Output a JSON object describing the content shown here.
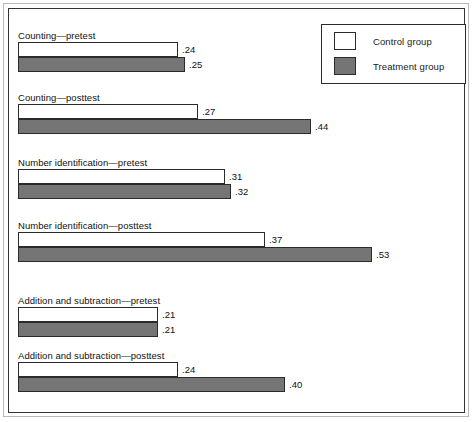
{
  "chart_data": {
    "type": "bar",
    "orientation": "horizontal",
    "title": "",
    "xlabel": "",
    "ylabel": "",
    "xlim": [
      0,
      0.62
    ],
    "grid": false,
    "legend_position": "top-right",
    "categories": [
      "Counting—pretest",
      "Counting—posttest",
      "Number identification—pretest",
      "Number identification—posttest",
      "Addition and subtraction—pretest",
      "Addition and subtraction—posttest"
    ],
    "series": [
      {
        "name": "Control group",
        "color": "#ffffff",
        "values": [
          0.24,
          0.27,
          0.31,
          0.37,
          0.21,
          0.24
        ],
        "labels": [
          ".24",
          ".27",
          ".31",
          ".37",
          ".21",
          ".24"
        ]
      },
      {
        "name": "Treatment group",
        "color": "#757575",
        "values": [
          0.25,
          0.44,
          0.32,
          0.53,
          0.21,
          0.4
        ],
        "labels": [
          ".25",
          ".44",
          ".32",
          ".53",
          ".21",
          ".40"
        ]
      }
    ]
  },
  "legend": {
    "entries": [
      {
        "label": "Control group",
        "swatch": "control"
      },
      {
        "label": "Treatment group",
        "swatch": "treatment"
      }
    ]
  },
  "groups": [
    {
      "label": "Counting—pretest",
      "top": 20,
      "bars": [
        {
          "series": "control",
          "value": 0.24,
          "label": ".24"
        },
        {
          "series": "treatment",
          "value": 0.25,
          "label": ".25"
        }
      ]
    },
    {
      "label": "Counting—posttest",
      "top": 82,
      "bars": [
        {
          "series": "control",
          "value": 0.27,
          "label": ".27"
        },
        {
          "series": "treatment",
          "value": 0.44,
          "label": ".44"
        }
      ]
    },
    {
      "label": "Number identification—pretest",
      "top": 147,
      "bars": [
        {
          "series": "control",
          "value": 0.31,
          "label": ".31"
        },
        {
          "series": "treatment",
          "value": 0.32,
          "label": ".32"
        }
      ]
    },
    {
      "label": "Number identification—posttest",
      "top": 210,
      "bars": [
        {
          "series": "control",
          "value": 0.37,
          "label": ".37"
        },
        {
          "series": "treatment",
          "value": 0.53,
          "label": ".53"
        }
      ]
    },
    {
      "label": "Addition and subtraction—pretest",
      "top": 285,
      "bars": [
        {
          "series": "control",
          "value": 0.21,
          "label": ".21"
        },
        {
          "series": "treatment",
          "value": 0.21,
          "label": ".21"
        }
      ]
    },
    {
      "label": "Addition and subtraction—posttest",
      "top": 340,
      "bars": [
        {
          "series": "control",
          "value": 0.24,
          "label": ".24"
        },
        {
          "series": "treatment",
          "value": 0.4,
          "label": ".40"
        }
      ]
    }
  ],
  "scale": {
    "pixels_per_unit": 667,
    "bar_origin_x": 9
  }
}
